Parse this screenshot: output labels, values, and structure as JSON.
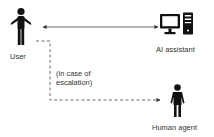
{
  "nodes": {
    "user": {
      "label": "User",
      "icon": "person-icon"
    },
    "ai_assistant": {
      "label": "AI assistant",
      "icon": "desktop-computer-icon"
    },
    "human_agent": {
      "label": "Human agent",
      "icon": "person-icon"
    }
  },
  "edges": {
    "user_ai": {
      "style": "solid",
      "direction": "bidirectional"
    },
    "escalation": {
      "style": "dashed",
      "direction": "user-to-human-agent",
      "note_line1": "(in case of",
      "note_line2": "escalation)"
    }
  },
  "colors": {
    "icon": "#111111",
    "line": "#444444",
    "text": "#333333",
    "background": "#ffffff"
  }
}
